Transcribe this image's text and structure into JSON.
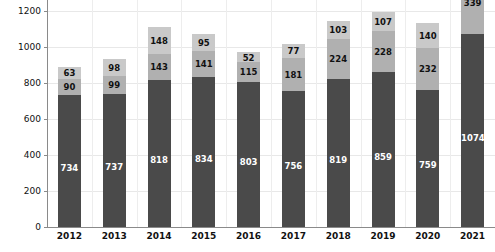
{
  "chart_data": {
    "type": "bar",
    "subtype": "stacked-bar",
    "title": "",
    "xlabel": "",
    "ylabel": "",
    "categories": [
      "2012",
      "2013",
      "2014",
      "2015",
      "2016",
      "2017",
      "2018",
      "2019",
      "2020",
      "2021"
    ],
    "ylim": [
      0,
      1260
    ],
    "yticks": [
      0,
      200,
      400,
      600,
      800,
      1000,
      1200
    ],
    "ytick_labels": [
      "0",
      "200",
      "400",
      "600",
      "800",
      "1000",
      "1200"
    ],
    "grid": true,
    "legend": "none",
    "colors": {
      "series_bottom": "#4a4a4a",
      "series_middle": "#b0b0b0",
      "series_top": "#c9c9c9",
      "gridline": "#e8e8e8",
      "axis": "#8a8a8a",
      "label_on_dark": "#ffffff",
      "label_on_light": "#111111",
      "background": "#ffffff"
    },
    "series": [
      {
        "name": "bottom",
        "values": [
          734,
          737,
          818,
          834,
          803,
          756,
          819,
          859,
          759,
          1074
        ]
      },
      {
        "name": "middle",
        "values": [
          90,
          99,
          143,
          141,
          115,
          181,
          224,
          228,
          232,
          339
        ]
      },
      {
        "name": "top",
        "values": [
          63,
          98,
          148,
          95,
          52,
          77,
          103,
          107,
          140,
          null
        ]
      }
    ],
    "totals": [
      887,
      934,
      1109,
      1070,
      970,
      1014,
      1146,
      1194,
      1131,
      1413
    ]
  },
  "axis": {
    "y_ticks": [
      "1200",
      "1000",
      "800",
      "600",
      "400",
      "200",
      "0"
    ],
    "x_ticks": [
      "2012",
      "2013",
      "2014",
      "2015",
      "2016",
      "2017",
      "2018",
      "2019",
      "2020",
      "2021"
    ]
  },
  "bars": [
    {
      "year": "2012",
      "bottom": 734,
      "middle": 90,
      "top": 63
    },
    {
      "year": "2013",
      "bottom": 737,
      "middle": 99,
      "top": 98
    },
    {
      "year": "2014",
      "bottom": 818,
      "middle": 143,
      "top": 148
    },
    {
      "year": "2015",
      "bottom": 834,
      "middle": 141,
      "top": 95
    },
    {
      "year": "2016",
      "bottom": 803,
      "middle": 115,
      "top": 52
    },
    {
      "year": "2017",
      "bottom": 756,
      "middle": 181,
      "top": 77
    },
    {
      "year": "2018",
      "bottom": 819,
      "middle": 224,
      "top": 103
    },
    {
      "year": "2019",
      "bottom": 859,
      "middle": 228,
      "top": 107
    },
    {
      "year": "2020",
      "bottom": 759,
      "middle": 232,
      "top": 140
    },
    {
      "year": "2021",
      "bottom": 1074,
      "middle": 339,
      "top": null
    }
  ]
}
